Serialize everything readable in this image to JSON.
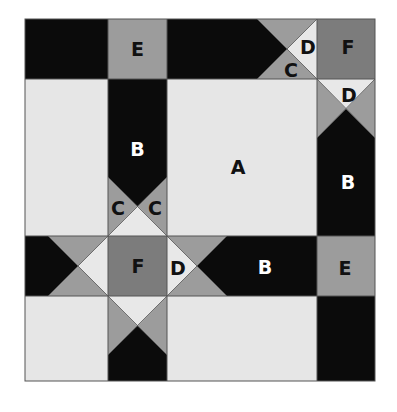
{
  "diagram": {
    "type": "quilt-block-piece-layout",
    "colors": {
      "black": "#0b0b0b",
      "light": "#e6e6e6",
      "medium": "#9c9c9c",
      "dark_gray": "#7c7c7c",
      "light_triangle": "#e8e8e8",
      "border": "#555555",
      "label_dark": "#111111",
      "label_light": "#ffffff"
    },
    "labels": {
      "a_center": "A",
      "b_top_arm": "B",
      "b_right_column": "B",
      "b_middle_row": "B",
      "c_top_left": "C",
      "c_top_right": "C",
      "c_corner": "C",
      "d_corner_left": "D",
      "d_corner_below": "D",
      "d_middle": "D",
      "e_top": "E",
      "e_right": "E",
      "f_corner": "F",
      "f_center": "F"
    }
  }
}
